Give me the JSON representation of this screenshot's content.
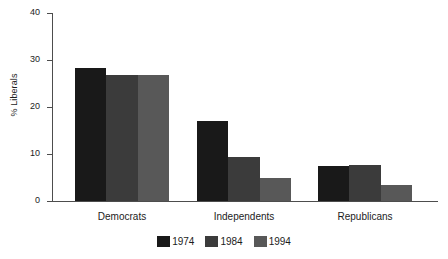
{
  "chart_data": {
    "type": "bar",
    "title": "",
    "subtitle": "",
    "xlabel": "",
    "ylabel": "% Liberals",
    "ylim": [
      0,
      40
    ],
    "yticks": [
      0,
      10,
      20,
      30,
      40
    ],
    "ytick_labels": [
      "0",
      "10",
      "20",
      "30",
      "40"
    ],
    "grid": false,
    "legend_position": "bottom-center",
    "categories": [
      "Democrats",
      "Independents",
      "Republicans"
    ],
    "series": [
      {
        "name": "1974",
        "color": "#191919",
        "values": [
          28.3,
          17.0,
          7.5
        ]
      },
      {
        "name": "1984",
        "color": "#3b3b3b",
        "values": [
          26.9,
          9.4,
          7.7
        ]
      },
      {
        "name": "1994",
        "color": "#585858",
        "values": [
          26.9,
          4.9,
          3.5
        ]
      }
    ]
  },
  "axes": {
    "y_title": "% Liberals"
  }
}
